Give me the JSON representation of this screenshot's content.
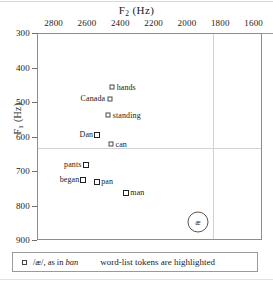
{
  "figure": {
    "badge_symbol": "æ"
  },
  "chart_data": {
    "type": "scatter",
    "title": "F2 (Hz)",
    "title_base": "F",
    "title_sub": "2",
    "title_unit": " (Hz)",
    "xlabel": "F2 (Hz)",
    "ylabel": "F1 (Hz)",
    "ylabel_base": "F",
    "ylabel_sub": "1",
    "ylabel_unit": " (Hz)",
    "xlim": [
      2900,
      1550
    ],
    "ylim": [
      300,
      900
    ],
    "x_reversed": true,
    "y_reversed": true,
    "grid": false,
    "xticks": [
      2800,
      2600,
      2400,
      2200,
      2000,
      1800,
      1600
    ],
    "yticks": [
      300,
      400,
      500,
      600,
      700,
      800,
      900
    ],
    "crosshair": {
      "x": 1850,
      "y": 630
    },
    "points": [
      {
        "label": "hands",
        "f2": 2455,
        "f1": 455,
        "highlighted": false,
        "label_pos": "right"
      },
      {
        "label": "Canada",
        "f2": 2470,
        "f1": 487,
        "highlighted": false,
        "label_pos": "left"
      },
      {
        "label": "standing",
        "f2": 2478,
        "f1": 535,
        "highlighted": false,
        "label_pos": "right"
      },
      {
        "label": "Dan",
        "f2": 2545,
        "f1": 592,
        "highlighted": true,
        "label_pos": "left"
      },
      {
        "label": "can",
        "f2": 2462,
        "f1": 620,
        "highlighted": false,
        "label_pos": "right"
      },
      {
        "label": "pants",
        "f2": 2615,
        "f1": 680,
        "highlighted": true,
        "label_pos": "left"
      },
      {
        "label": "began",
        "f2": 2628,
        "f1": 722,
        "highlighted": true,
        "label_pos": "left"
      },
      {
        "label": "pan",
        "f2": 2545,
        "f1": 730,
        "highlighted": true,
        "label_pos": "right"
      },
      {
        "label": "man",
        "f2": 2370,
        "f1": 762,
        "highlighted": true,
        "label_pos": "right"
      }
    ],
    "annotations": [
      {
        "kind": "vowel-badge",
        "text": "æ",
        "f2": 1940,
        "f1": 846
      }
    ]
  },
  "legend": {
    "symbol_text": "/æ/, as in ",
    "symbol_italic": "ban",
    "note": "word-list tokens are highlighted"
  }
}
